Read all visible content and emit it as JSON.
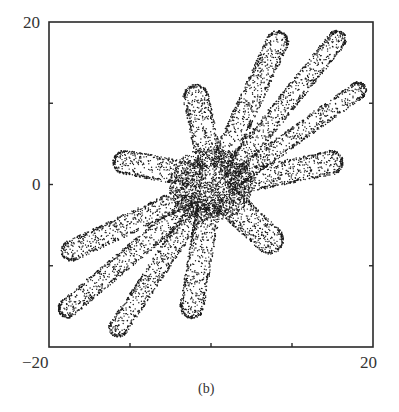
{
  "chart_data": {
    "type": "scatter",
    "title": "",
    "caption": "(b)",
    "xlabel": "",
    "ylabel": "",
    "xlim": [
      -20,
      20
    ],
    "ylim": [
      -20,
      20
    ],
    "x_tick_labels": [
      "-20",
      "20"
    ],
    "y_tick_labels": [
      "20",
      "0"
    ],
    "x_ticks": [
      -20,
      -10,
      0,
      10,
      20
    ],
    "y_ticks": [
      -20,
      -10,
      0,
      10,
      20
    ],
    "grid": false,
    "legend": null,
    "core": {
      "center": [
        0,
        0
      ],
      "radius": 4.5
    },
    "lobes": [
      {
        "name": "up-left",
        "from": [
          0,
          2
        ],
        "to": [
          -2.2,
          12.3
        ],
        "width": 3.2
      },
      {
        "name": "up",
        "from": [
          1,
          2
        ],
        "to": [
          8.8,
          18.8
        ],
        "width": 2.8
      },
      {
        "name": "upper-right-1",
        "from": [
          2,
          1
        ],
        "to": [
          16.3,
          18.7
        ],
        "width": 2.4
      },
      {
        "name": "upper-right-2",
        "from": [
          2,
          0
        ],
        "to": [
          19,
          12.2
        ],
        "width": 2.2
      },
      {
        "name": "right",
        "from": [
          2,
          0
        ],
        "to": [
          16.3,
          3
        ],
        "width": 3.0
      },
      {
        "name": "left",
        "from": [
          -1,
          1
        ],
        "to": [
          -12.1,
          3
        ],
        "width": 3.0
      },
      {
        "name": "lower-right",
        "from": [
          1,
          -1
        ],
        "to": [
          8.5,
          -8
        ],
        "width": 3.6
      },
      {
        "name": "lower-left-1",
        "from": [
          -2,
          -1
        ],
        "to": [
          -18.4,
          -8.7
        ],
        "width": 2.6
      },
      {
        "name": "lower-left-2",
        "from": [
          -2,
          -2
        ],
        "to": [
          -18.6,
          -16
        ],
        "width": 2.4
      },
      {
        "name": "lower-left-3",
        "from": [
          -1,
          -2
        ],
        "to": [
          -12.1,
          -18.6
        ],
        "width": 2.4
      },
      {
        "name": "down",
        "from": [
          0,
          -1
        ],
        "to": [
          -2.6,
          -16.5
        ],
        "width": 3.0
      }
    ],
    "point_color": "#1a1a1a"
  },
  "labels": {
    "y_top": "20",
    "y_mid": "0",
    "x_left": "−20",
    "x_right": "20",
    "caption": "(b)"
  }
}
